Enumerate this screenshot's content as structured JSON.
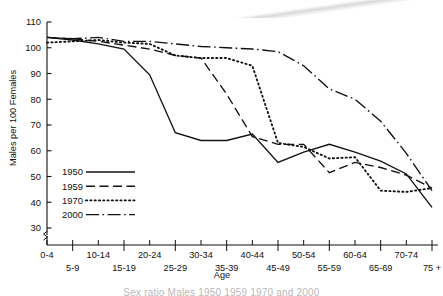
{
  "figure": {
    "background_color": "#ffffff",
    "ink_color": "#111111"
  },
  "axes": {
    "ylabel": "Males per 100 Females",
    "xlabel": "Age",
    "y_ticks": [
      30,
      40,
      50,
      60,
      70,
      80,
      90,
      100,
      110
    ],
    "y_tick_labels": [
      "30",
      "40",
      "50",
      "60",
      "70",
      "80",
      "90",
      "100",
      "110"
    ],
    "axis_break_symbol": "break",
    "x_labels_upper": [
      "0-4",
      "10-14",
      "20-24",
      "30-34",
      "40-44",
      "50-54",
      "60-64",
      "70-74"
    ],
    "x_labels_lower": [
      "5-9",
      "15-19",
      "25-29",
      "35-39",
      "45-49",
      "55-59",
      "65-69",
      "75 +"
    ]
  },
  "legend": {
    "position": "inner-lower-left",
    "entries": [
      {
        "label": "1950",
        "style": "solid"
      },
      {
        "label": "1959",
        "style": "dashed"
      },
      {
        "label": "1970",
        "style": "dotted"
      },
      {
        "label": "2000",
        "style": "dashdot"
      }
    ]
  },
  "caption_cropped": "Sex ratio Males 1950 1959 1970 and 2000",
  "chart_data": {
    "type": "line",
    "title": "",
    "xlabel": "Age",
    "ylabel": "Males per 100 Females",
    "ylim": [
      30,
      110
    ],
    "grid": false,
    "legend_position": "inner-lower-left",
    "categories": [
      "0-4",
      "5-9",
      "10-14",
      "15-19",
      "20-24",
      "25-29",
      "30-34",
      "35-39",
      "40-44",
      "45-49",
      "50-54",
      "55-59",
      "60-64",
      "65-69",
      "70-74",
      "75 +"
    ],
    "series": [
      {
        "name": "1950",
        "style": "solid",
        "values": [
          104.0,
          103.0,
          101.5,
          99.5,
          89.5,
          67.0,
          64.0,
          64.0,
          66.5,
          55.5,
          59.5,
          62.5,
          59.5,
          56.0,
          51.0,
          38.0
        ]
      },
      {
        "name": "1959",
        "style": "dashed",
        "values": [
          104.0,
          103.5,
          102.5,
          101.0,
          99.5,
          97.0,
          96.0,
          82.0,
          65.5,
          62.5,
          62.5,
          51.5,
          55.5,
          53.5,
          50.5,
          45.5
        ]
      },
      {
        "name": "1970",
        "style": "dotted",
        "values": [
          102.0,
          102.5,
          103.0,
          102.0,
          101.5,
          97.0,
          96.0,
          96.0,
          93.0,
          63.0,
          61.5,
          57.0,
          57.5,
          44.5,
          44.0,
          45.5
        ]
      },
      {
        "name": "2000",
        "style": "dashdot",
        "values": [
          104.0,
          103.5,
          104.0,
          102.5,
          102.5,
          101.5,
          100.5,
          100.0,
          99.5,
          98.5,
          93.0,
          84.0,
          80.0,
          71.5,
          59.0,
          44.5
        ]
      }
    ]
  }
}
